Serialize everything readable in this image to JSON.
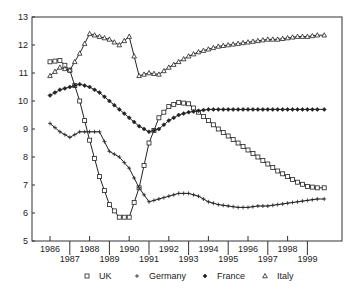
{
  "chart_data": {
    "type": "line",
    "title": "",
    "xlabel": "",
    "ylabel": "",
    "ylim": [
      5,
      13
    ],
    "xlim": [
      1985.1,
      2000.7
    ],
    "grid": false,
    "legend_position": "bottom",
    "y_ticks": [
      "5",
      "6",
      "7",
      "8",
      "9",
      "10",
      "11",
      "12",
      "13"
    ],
    "x_ticks_upper": [
      "1986",
      "1988",
      "1990",
      "1992",
      "1994",
      "1996",
      "1998"
    ],
    "x_ticks_lower": [
      "1987",
      "1989",
      "1991",
      "1993",
      "1995",
      "1997",
      "1999"
    ],
    "x": [
      1986.0,
      1986.5,
      1987.0,
      1987.5,
      1988.0,
      1988.5,
      1989.0,
      1989.5,
      1990.0,
      1990.5,
      1991.0,
      1991.5,
      1992.0,
      1992.5,
      1993.0,
      1993.5,
      1994.0,
      1994.5,
      1995.0,
      1995.5,
      1996.0,
      1996.5,
      1997.0,
      1997.5,
      1998.0,
      1998.5,
      1999.0,
      1999.5,
      1999.85
    ],
    "series": [
      {
        "name": "UK",
        "marker": "square",
        "values": [
          11.4,
          11.45,
          11.1,
          10.0,
          8.6,
          7.3,
          6.3,
          5.85,
          5.85,
          6.9,
          8.5,
          9.4,
          9.8,
          9.95,
          9.9,
          9.6,
          9.3,
          9.0,
          8.75,
          8.5,
          8.25,
          8.0,
          7.75,
          7.5,
          7.3,
          7.1,
          6.95,
          6.9,
          6.9
        ]
      },
      {
        "name": "Germany",
        "marker": "plus",
        "values": [
          9.2,
          8.9,
          8.7,
          8.9,
          8.9,
          8.9,
          8.2,
          8.0,
          7.6,
          6.9,
          6.4,
          6.5,
          6.6,
          6.7,
          6.7,
          6.6,
          6.4,
          6.3,
          6.25,
          6.2,
          6.2,
          6.25,
          6.25,
          6.3,
          6.35,
          6.4,
          6.45,
          6.5,
          6.5
        ]
      },
      {
        "name": "France",
        "marker": "diamond",
        "values": [
          10.2,
          10.4,
          10.5,
          10.6,
          10.5,
          10.3,
          10.0,
          9.7,
          9.4,
          9.1,
          8.9,
          9.0,
          9.3,
          9.5,
          9.6,
          9.65,
          9.7,
          9.7,
          9.7,
          9.7,
          9.7,
          9.7,
          9.7,
          9.7,
          9.7,
          9.7,
          9.7,
          9.7,
          9.7
        ]
      },
      {
        "name": "Italy",
        "marker": "triangle",
        "values": [
          10.9,
          11.2,
          11.1,
          11.7,
          12.4,
          12.3,
          12.2,
          12.0,
          12.3,
          10.9,
          11.0,
          10.95,
          11.2,
          11.4,
          11.6,
          11.75,
          11.85,
          11.95,
          12.0,
          12.05,
          12.1,
          12.15,
          12.2,
          12.2,
          12.25,
          12.3,
          12.3,
          12.35,
          12.35
        ]
      }
    ]
  },
  "legend": [
    {
      "label": "UK",
      "symbol": "□"
    },
    {
      "label": "Germany",
      "symbol": "+"
    },
    {
      "label": "France",
      "symbol": "◇"
    },
    {
      "label": "Italy",
      "symbol": "△"
    }
  ]
}
